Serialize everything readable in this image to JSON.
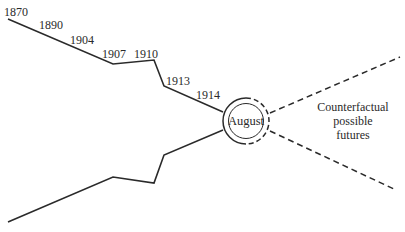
{
  "diagram": {
    "type": "funnel-timeline",
    "years": [
      "1870",
      "1890",
      "1904",
      "1907",
      "1910",
      "1913",
      "1914"
    ],
    "focal_point": "August",
    "counterfactual_label": [
      "Counterfactual",
      "possible",
      "futures"
    ],
    "colors": {
      "line": "#2a2a2a",
      "background": "#ffffff"
    }
  }
}
